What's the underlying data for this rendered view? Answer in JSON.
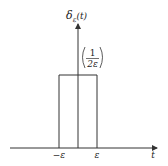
{
  "diagram": {
    "y_axis_label": "δ",
    "y_axis_label_sub": "ε",
    "y_axis_label_arg": "(t)",
    "x_axis_label": "t",
    "pulse_height_numerator": "1",
    "pulse_height_denominator": "2ε",
    "left_tick_label": "−ε",
    "right_tick_label": "ε",
    "colors": {
      "line": "#333333",
      "text": "#222222",
      "background": "#ffffff"
    }
  }
}
